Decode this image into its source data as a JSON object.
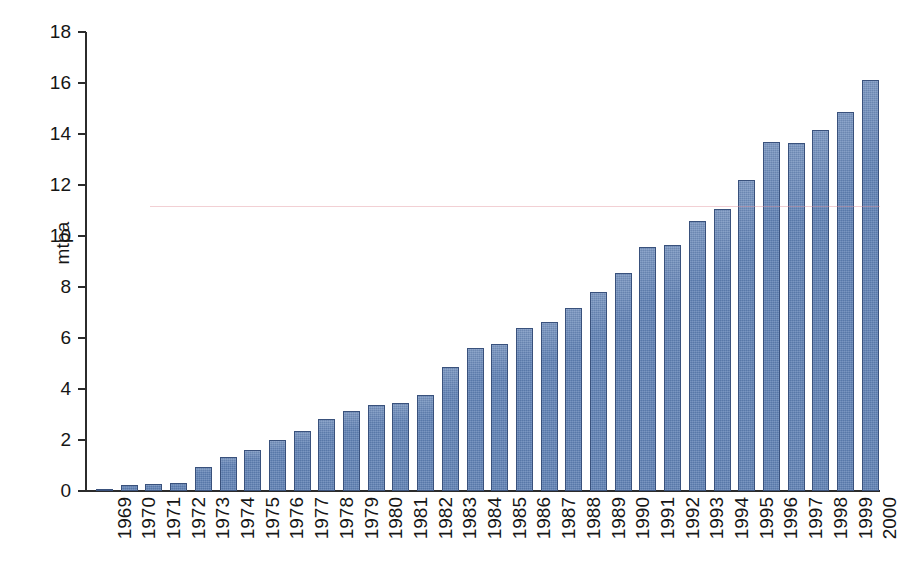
{
  "chart_data": {
    "type": "bar",
    "title": "",
    "subtitle": "",
    "xlabel": "",
    "ylabel": "mtpa",
    "ylim": [
      0,
      18
    ],
    "ytick_step": 2,
    "ytick_labels": [
      "0",
      "2",
      "4",
      "6",
      "8",
      "10",
      "12",
      "14",
      "16",
      "18"
    ],
    "grid": false,
    "legend": null,
    "bar_color": "#5e80b4",
    "bar_edge_color": "#39517c",
    "axis_color": "#2b2b2b",
    "background_color": "#ffffff",
    "categories": [
      "1969",
      "1970",
      "1971",
      "1972",
      "1973",
      "1974",
      "1975",
      "1976",
      "1977",
      "1978",
      "1979",
      "1980",
      "1981",
      "1982",
      "1983",
      "1984",
      "1985",
      "1986",
      "1987",
      "1988",
      "1989",
      "1990",
      "1991",
      "1992",
      "1993",
      "1994",
      "1995",
      "1996",
      "1997",
      "1998",
      "1999",
      "2000"
    ],
    "values": [
      0.08,
      0.25,
      0.27,
      0.33,
      0.95,
      1.32,
      1.62,
      2.02,
      2.36,
      2.82,
      3.12,
      3.38,
      3.45,
      3.75,
      4.85,
      5.62,
      5.78,
      6.38,
      6.62,
      7.17,
      7.82,
      8.55,
      9.55,
      9.65,
      10.6,
      11.05,
      12.2,
      13.7,
      13.65,
      14.15,
      14.85,
      16.1
    ]
  }
}
